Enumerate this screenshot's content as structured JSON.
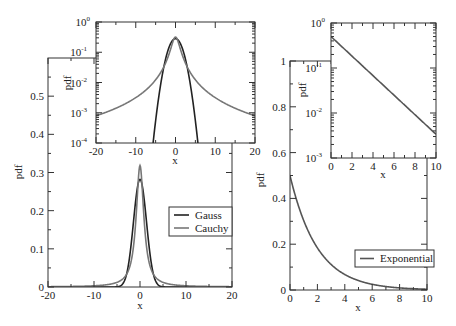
{
  "colors": {
    "gauss": "#222222",
    "cauchy": "#777777",
    "exponential": "#555555",
    "frame": "#333333"
  },
  "chart_data": [
    {
      "id": "left-main",
      "type": "line",
      "title": "",
      "xlabel": "x",
      "ylabel": "pdf",
      "xlim": [
        -20,
        20
      ],
      "ylim": [
        0,
        0.6
      ],
      "yscale": "linear",
      "xticks": [
        -20,
        -10,
        0,
        10,
        20
      ],
      "xtick_labels": [
        "-20",
        "-10",
        "0",
        "10",
        "20"
      ],
      "yticks": [
        0,
        0.1,
        0.2,
        0.3,
        0.4,
        0.5
      ],
      "ytick_labels": [
        "0",
        "0.1",
        "0.2",
        "0.3",
        "0.4",
        "0.5"
      ],
      "grid": false,
      "legend_position": "center-right",
      "series": [
        {
          "name": "Gauss",
          "distribution": "normal",
          "mean": 0,
          "sigma": 1.414,
          "peak": 0.282,
          "x": [
            -20,
            -6,
            -4,
            -3,
            -2,
            -1,
            0,
            1,
            2,
            3,
            4,
            6,
            20
          ],
          "values": [
            0,
            0.0003,
            0.0038,
            0.0291,
            0.1038,
            0.2197,
            0.2821,
            0.2197,
            0.1038,
            0.0291,
            0.0038,
            0.0003,
            0
          ]
        },
        {
          "name": "Cauchy",
          "distribution": "cauchy",
          "location": 0,
          "gamma": 1,
          "peak": 0.318,
          "x": [
            -20,
            -10,
            -5,
            -3,
            -2,
            -1,
            0,
            1,
            2,
            3,
            5,
            10,
            20
          ],
          "values": [
            0.0008,
            0.0032,
            0.0122,
            0.0318,
            0.0637,
            0.1592,
            0.3183,
            0.1592,
            0.0637,
            0.0318,
            0.0122,
            0.0032,
            0.0008
          ]
        }
      ]
    },
    {
      "id": "left-inset",
      "type": "line",
      "title": "",
      "xlabel": "x",
      "ylabel": "pdf",
      "xlim": [
        -20,
        20
      ],
      "ylim": [
        0.0001,
        1
      ],
      "yscale": "log",
      "xticks": [
        -20,
        -10,
        0,
        10,
        20
      ],
      "xtick_labels": [
        "-20",
        "-10",
        "0",
        "10",
        "20"
      ],
      "yticks_exp": [
        0,
        -1,
        -2,
        -3,
        -4
      ],
      "grid": false,
      "series": [
        {
          "name": "Gauss",
          "distribution": "normal",
          "mean": 0,
          "sigma": 1.414
        },
        {
          "name": "Cauchy",
          "distribution": "cauchy",
          "location": 0,
          "gamma": 1
        }
      ]
    },
    {
      "id": "right-main",
      "type": "line",
      "title": "",
      "xlabel": "x",
      "ylabel": "pdf",
      "xlim": [
        0,
        10
      ],
      "ylim": [
        0,
        1
      ],
      "yscale": "linear",
      "xticks": [
        0,
        2,
        4,
        6,
        8,
        10
      ],
      "xtick_labels": [
        "0",
        "2",
        "4",
        "6",
        "8",
        "10"
      ],
      "yticks": [
        0,
        0.2,
        0.4,
        0.6,
        0.8,
        1
      ],
      "ytick_labels": [
        "0",
        "0.2",
        "0.4",
        "0.6",
        "0.8",
        "1"
      ],
      "grid": false,
      "legend_position": "lower-right",
      "series": [
        {
          "name": "Exponential",
          "distribution": "exponential",
          "rate": 0.5,
          "x": [
            0,
            1,
            2,
            3,
            4,
            5,
            6,
            7,
            8,
            9,
            10
          ],
          "values": [
            0.5,
            0.303,
            0.184,
            0.112,
            0.068,
            0.041,
            0.025,
            0.015,
            0.009,
            0.006,
            0.003
          ]
        }
      ]
    },
    {
      "id": "right-inset",
      "type": "line",
      "title": "",
      "xlabel": "x",
      "ylabel": "pdf",
      "xlim": [
        0,
        10
      ],
      "ylim": [
        0.001,
        1
      ],
      "yscale": "log",
      "xticks": [
        0,
        2,
        4,
        6,
        8,
        10
      ],
      "xtick_labels": [
        "0",
        "2",
        "4",
        "6",
        "8",
        "10"
      ],
      "yticks_exp": [
        0,
        -1,
        -2,
        -3
      ],
      "grid": false,
      "series": [
        {
          "name": "Exponential",
          "distribution": "exponential",
          "rate": 0.5
        }
      ]
    }
  ],
  "legends": {
    "left": [
      "Gauss",
      "Cauchy"
    ],
    "right": [
      "Exponential"
    ]
  },
  "labels": {
    "x": "x",
    "pdf": "pdf",
    "log_base": "10"
  }
}
